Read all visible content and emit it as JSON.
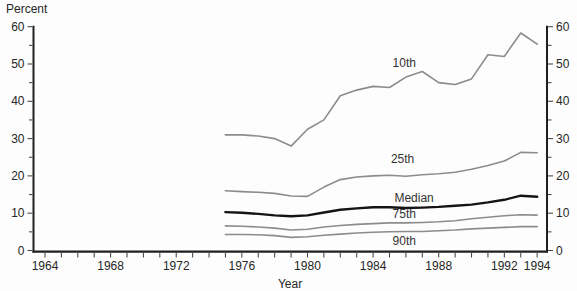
{
  "chart_data": {
    "type": "line",
    "title": "",
    "xlabel": "Year",
    "ylabel": "Percent",
    "xlim": [
      1963.3,
      1994.6
    ],
    "ylim": [
      0,
      60
    ],
    "grid": false,
    "legend": "inline-labels",
    "axis_color": "#1f1f1f",
    "x_tick_labels": [
      1964,
      1968,
      1972,
      1976,
      1980,
      1984,
      1988,
      1992,
      1994
    ],
    "x_minor_tick_step": 1,
    "y_tick_labels": [
      0,
      10,
      20,
      30,
      40,
      50,
      60
    ],
    "y_minor_tick_step": 5,
    "x": [
      1975,
      1976,
      1977,
      1978,
      1979,
      1980,
      1981,
      1982,
      1983,
      1984,
      1985,
      1986,
      1987,
      1988,
      1989,
      1990,
      1991,
      1992,
      1993,
      1994
    ],
    "series": [
      {
        "name": "10th",
        "color": "#8c8c8c",
        "width": 1.6,
        "label_x": 1985.9,
        "label_y": 50.3,
        "values": [
          31,
          31,
          30.7,
          30,
          28,
          32.5,
          35,
          41.5,
          43,
          44,
          43.7,
          46.5,
          48,
          45,
          44.5,
          46,
          52.5,
          52,
          58.3,
          55.3
        ]
      },
      {
        "name": "25th",
        "color": "#8c8c8c",
        "width": 1.6,
        "label_x": 1985.8,
        "label_y": 24.5,
        "values": [
          16,
          15.8,
          15.6,
          15.3,
          14.6,
          14.5,
          17,
          19,
          19.7,
          20,
          20.2,
          19.9,
          20.3,
          20.6,
          21,
          21.8,
          22.8,
          24,
          26.3,
          26.2
        ]
      },
      {
        "name": "Median",
        "color": "#141414",
        "width": 2.4,
        "label_x": 1986.5,
        "label_y": 14.1,
        "values": [
          10.3,
          10.1,
          9.8,
          9.4,
          9.2,
          9.4,
          10.2,
          10.9,
          11.3,
          11.6,
          11.6,
          11.4,
          11.5,
          11.7,
          12,
          12.3,
          12.9,
          13.6,
          14.7,
          14.4
        ]
      },
      {
        "name": "75th",
        "color": "#8c8c8c",
        "width": 1.6,
        "label_x": 1985.9,
        "label_y": 9.9,
        "values": [
          6.6,
          6.5,
          6.3,
          6,
          5.5,
          5.7,
          6.3,
          6.7,
          7,
          7.2,
          7.4,
          7.4,
          7.5,
          7.7,
          8,
          8.5,
          8.9,
          9.3,
          9.6,
          9.5
        ]
      },
      {
        "name": "90th",
        "color": "#8c8c8c",
        "width": 1.6,
        "label_x": 1985.9,
        "label_y": 2.6,
        "values": [
          4.3,
          4.3,
          4.2,
          4,
          3.5,
          3.7,
          4.1,
          4.4,
          4.7,
          4.9,
          5,
          5.1,
          5.1,
          5.3,
          5.5,
          5.8,
          6,
          6.2,
          6.4,
          6.4
        ]
      }
    ]
  }
}
